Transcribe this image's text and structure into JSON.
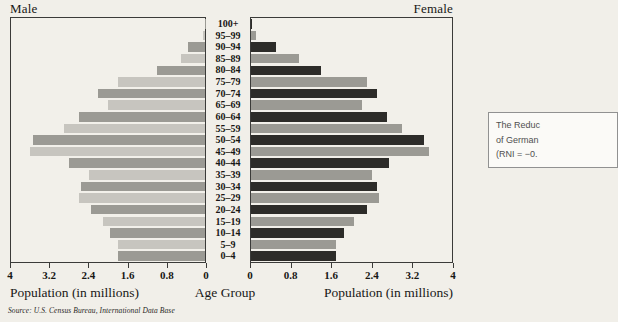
{
  "titles": {
    "male": "Male",
    "female": "Female"
  },
  "axis": {
    "male_ticks": [
      "4",
      "3.2",
      "2.4",
      "1.6",
      "0.8",
      "0"
    ],
    "female_ticks": [
      "0",
      "0.8",
      "1.6",
      "2.4",
      "3.2",
      "4"
    ],
    "male_axis_label": "Population (in millions)",
    "female_axis_label": "Population (in millions)",
    "center_axis_label": "Age Group",
    "max_value_millions": 4
  },
  "source": "Source: U.S. Census Bureau, International Data Base",
  "annotation_box": {
    "lines": [
      "The Reduc",
      "of German",
      "(RNI = −0."
    ]
  },
  "colors": {
    "page_background": "#f1efe9",
    "panel_background": "#f2f0ea",
    "panel_border": "#3b3b39",
    "male_bar_dark": "#9b9a94",
    "male_bar_light": "#c7c5bf",
    "female_bar_dark": "#2d2c29",
    "female_bar_medium": "#9b9a94",
    "text": "#181715"
  },
  "chart_data": {
    "type": "bar",
    "subtype": "population-pyramid",
    "orientation": "horizontal",
    "title": "",
    "categories_top_to_bottom": [
      "100+",
      "95–99",
      "90–94",
      "85–89",
      "80–84",
      "75–79",
      "70–74",
      "65–69",
      "60–64",
      "55–59",
      "50–54",
      "45–49",
      "40–44",
      "35–39",
      "30–34",
      "25–29",
      "20–24",
      "15–19",
      "10–14",
      "5–9",
      "0–4"
    ],
    "series": [
      {
        "name": "Male",
        "side": "left",
        "values_millions": [
          0.01,
          0.04,
          0.35,
          0.5,
          1.0,
          1.8,
          2.2,
          2.0,
          2.6,
          2.9,
          3.55,
          3.6,
          2.8,
          2.4,
          2.55,
          2.6,
          2.35,
          2.1,
          1.95,
          1.8,
          1.8
        ]
      },
      {
        "name": "Female",
        "side": "right",
        "values_millions": [
          0.02,
          0.1,
          0.5,
          0.95,
          1.4,
          2.3,
          2.5,
          2.2,
          2.7,
          3.0,
          3.45,
          3.55,
          2.75,
          2.4,
          2.5,
          2.55,
          2.3,
          2.05,
          1.85,
          1.7,
          1.7
        ]
      }
    ],
    "xlabel": "Population (in millions)",
    "center_label": "Age Group",
    "xlim": [
      0,
      4
    ],
    "tick_step": 0.8,
    "grid": false,
    "legend": "none"
  }
}
